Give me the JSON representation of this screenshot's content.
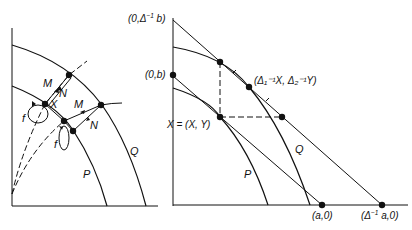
{
  "left_panel": {
    "curves": {
      "Q": "Q",
      "P": "P"
    },
    "labels": {
      "M_top": "M",
      "N_top": "N",
      "X": "X",
      "M_mid": "M",
      "N_mid": "N",
      "f_left": "f",
      "f_mid": "f"
    }
  },
  "right_panel": {
    "curves": {
      "Q": "Q",
      "P": "P"
    },
    "labels": {
      "y_top_prefix": "(0,",
      "y_top_delta": "Δ",
      "y_top_sub": "2",
      "y_top_sup": "−1",
      "y_top_suffix": "b)",
      "y_b": "(0,b)",
      "X_point": "X = (X, Y)",
      "tangent_point": "(Δ₁⁻¹X, Δ₂⁻¹Y)",
      "x_a": "(a,0)",
      "x_scaled_prefix": "(",
      "x_scaled_delta": "Δ",
      "x_scaled_sub": "1",
      "x_scaled_sup": "−1",
      "x_scaled_suffix": "a,0)"
    }
  },
  "colors": {
    "ink": "#111111",
    "background": "#ffffff"
  }
}
